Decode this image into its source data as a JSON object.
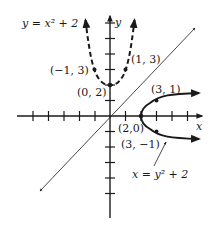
{
  "diagram": {
    "type": "coordinate-graph",
    "axes": {
      "x_label": "x",
      "y_label": "y",
      "x_ticks": [
        -6,
        -5,
        -4,
        -3,
        -2,
        -1,
        1,
        2,
        3,
        4,
        5,
        6
      ],
      "y_ticks": [
        -6,
        -5,
        -4,
        -3,
        -2,
        -1,
        1,
        2,
        3,
        4,
        5,
        6
      ]
    },
    "curves": [
      {
        "name": "y = x^2 + 2",
        "style": "dashed",
        "label": "y = x² + 2",
        "points": [
          [
            -1,
            3
          ],
          [
            0,
            2
          ],
          [
            1,
            3
          ]
        ]
      },
      {
        "name": "x = y^2 + 2",
        "style": "solid",
        "label": "x = y² + 2",
        "points": [
          [
            3,
            1
          ],
          [
            2,
            0
          ],
          [
            3,
            -1
          ]
        ]
      },
      {
        "name": "y = x",
        "style": "thin-solid",
        "label": ""
      }
    ],
    "point_labels": {
      "p_neg1_3": "(−1, 3)",
      "p_1_3": "(1, 3)",
      "p_0_2": "(0, 2)",
      "p_3_1": "(3, 1)",
      "p_2_0": "(2,0)",
      "p_3_neg1": "(3, −1)"
    },
    "equation_labels": {
      "parabola_up": "y = x² + 2",
      "parabola_right": "x = y² + 2"
    },
    "colors": {
      "ink": "#1a1a1a",
      "background": "#ffffff"
    }
  }
}
